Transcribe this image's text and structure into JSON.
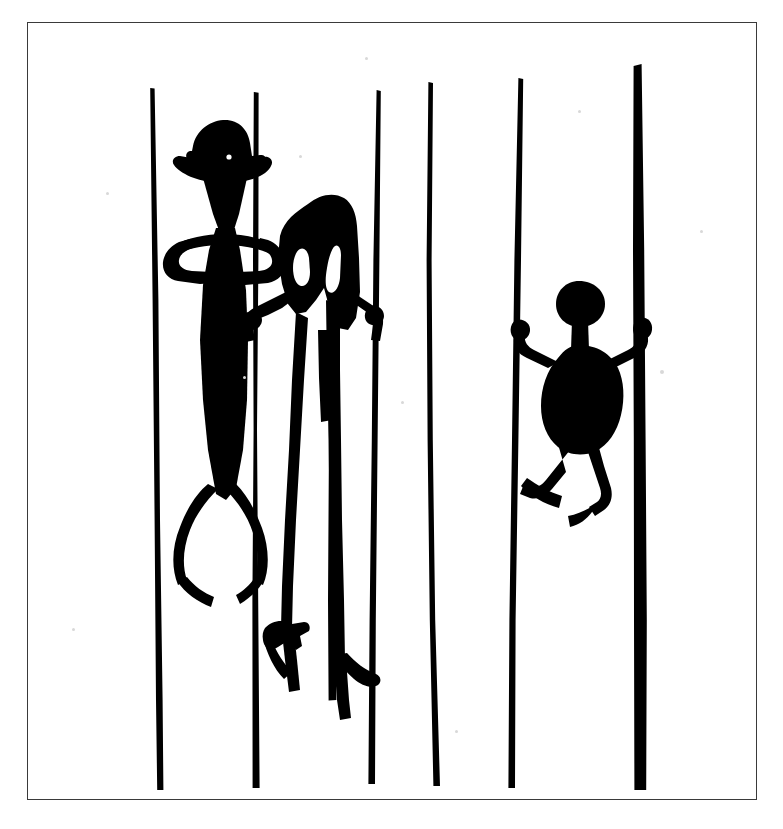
{
  "image": {
    "kind": "scanned-illustration",
    "subject": "rock-art-figures-among-vertical-lines",
    "background_color": "#ffffff",
    "ink_color": "#000000",
    "frame_color": "#3a3a3a",
    "caption": ""
  },
  "frame": {
    "x": 27,
    "y": 22,
    "width": 730,
    "height": 778,
    "stroke_width": 1.4
  },
  "vertical_lines": [
    {
      "id": "line-1",
      "label": "leftmost line",
      "x_top": 152,
      "y_top": 88,
      "x_bottom": 160,
      "y_bottom": 790,
      "width_top": 3.5,
      "width_bottom": 6
    },
    {
      "id": "line-2",
      "label": "second line",
      "x_top": 256,
      "y_top": 92,
      "x_bottom": 256,
      "y_bottom": 788,
      "width_top": 4,
      "width_bottom": 7
    },
    {
      "id": "line-3",
      "label": "third line",
      "x_top": 330,
      "y_top": 200,
      "x_bottom": 332,
      "y_bottom": 700,
      "width_top": 5,
      "width_bottom": 8
    },
    {
      "id": "line-4",
      "label": "fourth line",
      "x_top": 378,
      "y_top": 90,
      "x_bottom": 372,
      "y_bottom": 784,
      "width_top": 3.5,
      "width_bottom": 6
    },
    {
      "id": "line-5",
      "label": "fifth line",
      "x_top": 430,
      "y_top": 82,
      "x_bottom": 437,
      "y_bottom": 786,
      "width_top": 4,
      "width_bottom": 6
    },
    {
      "id": "line-6",
      "label": "sixth line",
      "x_top": 520,
      "y_top": 78,
      "x_bottom": 512,
      "y_bottom": 788,
      "width_top": 4,
      "width_bottom": 6
    },
    {
      "id": "line-7",
      "label": "rightmost thick line",
      "x_top": 637,
      "y_top": 64,
      "x_bottom": 640,
      "y_bottom": 790,
      "width_top": 7,
      "width_bottom": 11
    }
  ],
  "figures": [
    {
      "id": "figure-1",
      "label": "tall hatted figure holding two lines",
      "head": "wide-brimmed-hat-head",
      "body": "long tapering torso",
      "arms": "both arms bent, hands gripping the first and second vertical lines",
      "legs": "two bowed legs with long feet",
      "bbox": [
        160,
        120,
        105,
        430
      ]
    },
    {
      "id": "figure-2",
      "label": "large headed figure with two eye voids",
      "head": "broad mass with two white eye voids",
      "body": "dark mass merging with head",
      "arms": "two arms reaching left and right to the lines",
      "legs": "two very long legs ending in splayed feet",
      "bbox": [
        262,
        192,
        140,
        490
      ]
    },
    {
      "id": "figure-3",
      "label": "small round headed climbing figure",
      "head": "round head on thin neck",
      "body": "bulbous oval body",
      "arms": "two short straight arms raised outward",
      "legs": "two bent legs with feet pointing down-left and down-right",
      "bbox": [
        520,
        281,
        145,
        240
      ]
    }
  ],
  "specks": [
    {
      "x": 299,
      "y": 155,
      "size": 3
    },
    {
      "x": 578,
      "y": 110,
      "size": 3
    },
    {
      "x": 660,
      "y": 370,
      "size": 4
    },
    {
      "x": 243,
      "y": 376,
      "size": 3
    },
    {
      "x": 72,
      "y": 628,
      "size": 3
    },
    {
      "x": 455,
      "y": 730,
      "size": 3
    },
    {
      "x": 401,
      "y": 401,
      "size": 3
    },
    {
      "x": 106,
      "y": 192,
      "size": 3
    },
    {
      "x": 700,
      "y": 230,
      "size": 3
    },
    {
      "x": 365,
      "y": 57,
      "size": 3
    }
  ]
}
